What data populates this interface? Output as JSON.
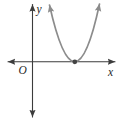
{
  "figure": {
    "type": "coordinate-plane-parabola",
    "labels": {
      "y_axis": "y",
      "x_axis": "x",
      "origin": "O"
    },
    "colors": {
      "background": "#ffffff",
      "axis": "#3c3c3c",
      "curve": "#8c8c8c",
      "point": "#424242",
      "label": "#1f1f1f"
    },
    "geometry": {
      "x_axis_d": "M 8 61.8 L 115 61.8",
      "y_axis_d": "M 32.5 4.5 L 32.5 117",
      "parabola_d": "M 49.5 5 Q 75 119 99.5 4",
      "vertex_point": {
        "cx": 74.8,
        "cy": 61.8,
        "r": 2.4
      }
    },
    "content": {
      "curve": "upward-opening parabola",
      "tangency": "vertex touches positive x-axis at marked point (double root)"
    }
  }
}
